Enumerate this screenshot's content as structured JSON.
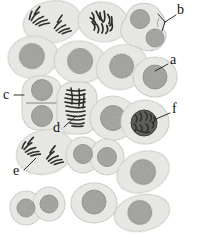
{
  "figure": {
    "background_color": "#ffffff",
    "width": 198,
    "height": 245,
    "colors": {
      "cytoplasm_fill": "#e9e9e6",
      "cytoplasm_stroke": "#b9b9b4",
      "cytoplasm_speckle": "#c9c9c3",
      "nucleus_fill": "#9d9d99",
      "nucleus_stroke": "#7e7e7a",
      "nucleus_speckle": "#6f6f6b",
      "chromosome_color": "#2b2b2b",
      "label_color": "#111111",
      "leader_line_color": "#1a1a1a"
    }
  },
  "labels": [
    {
      "id": "a",
      "text": "a",
      "x": 171,
      "y": 60,
      "name": "label-a",
      "description": "interphase cell with single round nucleus"
    },
    {
      "id": "b",
      "text": "b",
      "x": 178,
      "y": 8,
      "name": "label-b",
      "description": "cytokinesis, two daughter nuclei with cleavage furrow"
    },
    {
      "id": "c",
      "text": "c",
      "x": 4,
      "y": 90,
      "name": "label-c",
      "description": "telophase with cell plate between two nuclei"
    },
    {
      "id": "d",
      "text": "d",
      "x": 54,
      "y": 128,
      "name": "label-d",
      "description": "metaphase, chromosomes aligned at equator"
    },
    {
      "id": "e",
      "text": "e",
      "x": 14,
      "y": 172,
      "name": "label-e",
      "description": "anaphase, two separating chromosome groups"
    },
    {
      "id": "f",
      "text": "f",
      "x": 173,
      "y": 108,
      "name": "label-f",
      "description": "prophase, condensed chromatin in nucleus"
    }
  ],
  "leaders": [
    {
      "for": "a",
      "name": "leader-line-a",
      "path": "M168,64 L156,70"
    },
    {
      "for": "b",
      "name": "leader-line-b",
      "path": "M175,14 L165,21 L159,15 M165,21 L161,29"
    },
    {
      "for": "c",
      "name": "leader-line-c",
      "path": "M13,95 L24,95"
    },
    {
      "for": "d",
      "name": "leader-line-d",
      "path": "M63,127 L75,118"
    },
    {
      "for": "e",
      "name": "leader-line-e",
      "path": "M23,170 L34,159"
    },
    {
      "for": "f",
      "name": "leader-line-f",
      "path": "M170,113 L157,118"
    }
  ],
  "cells": [
    {
      "name": "cell-anaphase-top-left",
      "stage": "anaphase",
      "cx": 52,
      "cy": 22,
      "rx": 29,
      "ry": 21,
      "rot": -12,
      "nucleus": "none",
      "chromosomes": "two-groups"
    },
    {
      "name": "cell-metaphase-top-mid",
      "stage": "metaphase",
      "cx": 103,
      "cy": 22,
      "rx": 25,
      "ry": 20,
      "rot": 6,
      "nucleus": "none",
      "chromosomes": "scattered"
    },
    {
      "name": "cell-cytokinesis-top-right",
      "stage": "cytokinesis",
      "cx": 150,
      "cy": 28,
      "rx": 27,
      "ry": 25,
      "rot": 0,
      "nucleus": "double-offset",
      "chromosomes": "none"
    },
    {
      "name": "cell-interphase-left-1",
      "stage": "interphase",
      "cx": 33,
      "cy": 57,
      "rx": 25,
      "ry": 21,
      "rot": -8,
      "nucleus": "single",
      "chromosomes": "none"
    },
    {
      "name": "cell-interphase-mid-1",
      "stage": "interphase",
      "cx": 80,
      "cy": 62,
      "rx": 26,
      "ry": 21,
      "rot": 5,
      "nucleus": "single",
      "chromosomes": "none"
    },
    {
      "name": "cell-interphase-mid-2",
      "stage": "interphase",
      "cx": 122,
      "cy": 67,
      "rx": 25,
      "ry": 22,
      "rot": -20,
      "nucleus": "single",
      "chromosomes": "none"
    },
    {
      "name": "cell-interphase-right-a",
      "stage": "interphase",
      "cx": 157,
      "cy": 76,
      "rx": 22,
      "ry": 20,
      "rot": 0,
      "nucleus": "single",
      "chromosomes": "none"
    },
    {
      "name": "cell-telophase-c",
      "stage": "telophase",
      "cx": 42,
      "cy": 103,
      "rx": 20,
      "ry": 27,
      "rot": 0,
      "nucleus": "double-stacked",
      "chromosomes": "none"
    },
    {
      "name": "cell-metaphase-d",
      "stage": "metaphase",
      "cx": 77,
      "cy": 108,
      "rx": 20,
      "ry": 26,
      "rot": 0,
      "nucleus": "none",
      "chromosomes": "plate"
    },
    {
      "name": "cell-interphase-mid-3",
      "stage": "interphase",
      "cx": 113,
      "cy": 118,
      "rx": 23,
      "ry": 22,
      "rot": 0,
      "nucleus": "single",
      "chromosomes": "none"
    },
    {
      "name": "cell-prophase-f",
      "stage": "prophase",
      "cx": 145,
      "cy": 122,
      "rx": 24,
      "ry": 22,
      "rot": 0,
      "nucleus": "condensed",
      "chromosomes": "none"
    },
    {
      "name": "cell-anaphase-e",
      "stage": "anaphase",
      "cx": 45,
      "cy": 152,
      "rx": 29,
      "ry": 22,
      "rot": -14,
      "nucleus": "none",
      "chromosomes": "two-groups"
    },
    {
      "name": "cell-cytokinesis-mid",
      "stage": "cytokinesis",
      "cx": 95,
      "cy": 155,
      "rx": 26,
      "ry": 20,
      "rot": 0,
      "nucleus": "double-side",
      "chromosomes": "none"
    },
    {
      "name": "cell-interphase-right-b",
      "stage": "interphase",
      "cx": 143,
      "cy": 172,
      "rx": 27,
      "ry": 20,
      "rot": -22,
      "nucleus": "single",
      "chromosomes": "none"
    },
    {
      "name": "cell-cytokinesis-bottom",
      "stage": "cytokinesis",
      "cx": 38,
      "cy": 206,
      "rx": 25,
      "ry": 19,
      "rot": 0,
      "nucleus": "double-side",
      "chromosomes": "none"
    },
    {
      "name": "cell-interphase-bottom-1",
      "stage": "interphase",
      "cx": 94,
      "cy": 203,
      "rx": 22,
      "ry": 19,
      "rot": 0,
      "nucleus": "single",
      "chromosomes": "none"
    },
    {
      "name": "cell-interphase-bottom-2",
      "stage": "interphase",
      "cx": 142,
      "cy": 213,
      "rx": 27,
      "ry": 18,
      "rot": -12,
      "nucleus": "single",
      "chromosomes": "none"
    }
  ]
}
